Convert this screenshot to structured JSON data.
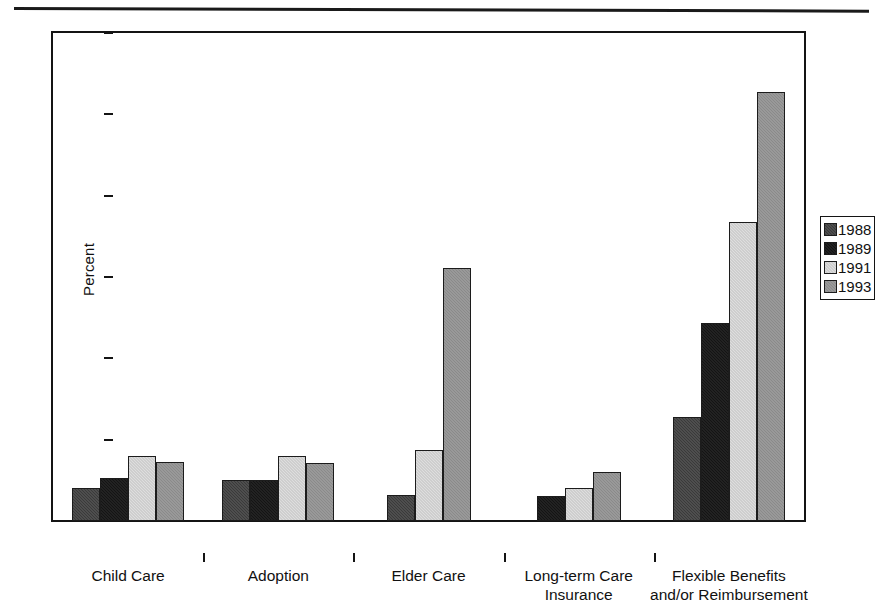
{
  "chart_data": {
    "type": "bar",
    "title": "",
    "xlabel": "",
    "ylabel": "Percent",
    "ylim": [
      0,
      60
    ],
    "yticks": [
      0,
      10,
      20,
      30,
      40,
      50,
      60
    ],
    "grid": false,
    "legend_position": "right",
    "categories": [
      "Child Care",
      "Adoption",
      "Elder Care",
      "Long-term Care\nInsurance",
      "Flexible Benefits\nand/or Reimbursement"
    ],
    "series": [
      {
        "name": "1988",
        "color": "#3a3a3a",
        "values": [
          4.0,
          5.1,
          3.2,
          null,
          12.8
        ]
      },
      {
        "name": "1989",
        "color": "#141414",
        "values": [
          5.3,
          5.1,
          null,
          3.1,
          24.3
        ]
      },
      {
        "name": "1991",
        "color": "#dedede",
        "values": [
          8.0,
          8.0,
          8.7,
          4.0,
          36.8
        ]
      },
      {
        "name": "1993",
        "color": "#8a8a8a",
        "values": [
          7.2,
          7.1,
          31.1,
          6.0,
          52.8
        ]
      }
    ]
  },
  "axis": {
    "y_label": "Percent",
    "y_tick_labels": [
      "0",
      "10",
      "20",
      "30",
      "40",
      "50",
      "60"
    ]
  },
  "legend": {
    "entries": [
      {
        "label": "1988"
      },
      {
        "label": "1989"
      },
      {
        "label": "1991"
      },
      {
        "label": "1993"
      }
    ]
  }
}
